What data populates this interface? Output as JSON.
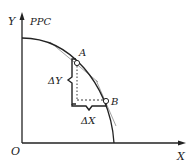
{
  "diagram": {
    "type": "production-possibilities-curve",
    "curve_label": "PPC",
    "axes": {
      "y_label": "Y",
      "x_label": "X",
      "origin_label": "O"
    },
    "points": [
      {
        "name": "A",
        "x": 77,
        "y": 63
      },
      {
        "name": "B",
        "x": 106,
        "y": 101
      }
    ],
    "brackets": {
      "delta_y_label": "ΔY",
      "delta_x_label": "ΔX"
    },
    "colors": {
      "line": "#222222",
      "tangent": "#999999",
      "background": "#ffffff"
    }
  }
}
